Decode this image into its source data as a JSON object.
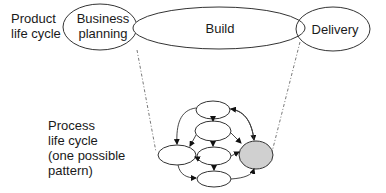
{
  "product_lifecycle": {
    "label_line1": "Product",
    "label_line2": "life cycle",
    "phases": [
      {
        "line1": "Business",
        "line2": "planning"
      },
      {
        "line1": "Build"
      },
      {
        "line1": "Delivery"
      }
    ]
  },
  "process_lifecycle": {
    "label_line1": "Process",
    "label_line2": "life cycle",
    "label_line3": "(one possible",
    "label_line4": "pattern)"
  },
  "colors": {
    "stroke": "#333333",
    "highlight_fill": "#d0d0d0",
    "dashed": "#555555"
  }
}
